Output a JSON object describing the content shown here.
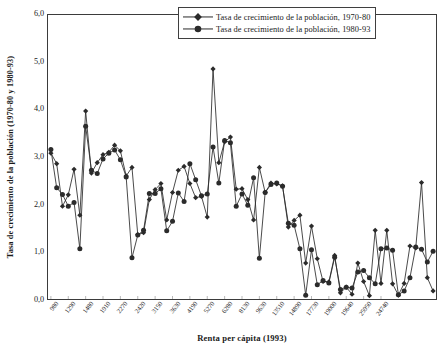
{
  "chart_data": {
    "type": "line",
    "title": "",
    "xlabel": "Renta per cápita (1993)",
    "ylabel": "Tasa de crecimiento de la población (1970-80 y 1980-93)",
    "ylim": [
      0.0,
      6.0
    ],
    "yticks": [
      "6,0",
      "5,0",
      "4,0",
      "3,0",
      "2,0",
      "1,0",
      "0,0"
    ],
    "ytick_values": [
      6.0,
      5.0,
      4.0,
      3.0,
      2.0,
      1.0,
      0.0
    ],
    "grid": false,
    "legend_position": "top-right",
    "xtick_labels": [
      "980",
      "1290",
      "1480",
      "1910",
      "2270",
      "2420",
      "3150",
      "3630",
      "4190",
      "5270",
      "6280",
      "8130",
      "9630",
      "13510",
      "14890",
      "17730",
      "19000",
      "19640",
      "25950",
      "24740"
    ],
    "xtick_indices": [
      0,
      3,
      6,
      9,
      12,
      15,
      18,
      21,
      24,
      27,
      30,
      33,
      36,
      39,
      42,
      45,
      48,
      51,
      54,
      57
    ],
    "series": [
      {
        "name": "Tasa de crecimiento de la población, 1970-80",
        "marker": "diamond",
        "color": "#2b2b2b",
        "values": [
          3.08,
          2.86,
          1.96,
          2.2,
          2.74,
          1.77,
          3.97,
          2.66,
          2.88,
          3.05,
          3.1,
          3.25,
          3.13,
          2.6,
          2.78,
          1.36,
          1.4,
          2.1,
          2.31,
          2.44,
          1.67,
          2.25,
          2.72,
          2.8,
          2.44,
          2.14,
          2.17,
          1.73,
          4.86,
          2.88,
          3.32,
          3.42,
          2.32,
          2.33,
          2.1,
          1.67,
          2.78,
          2.25,
          2.45,
          2.43,
          2.39,
          1.52,
          1.66,
          1.77,
          0.76,
          1.54,
          0.85,
          0.37,
          0.36,
          0.92,
          0.13,
          0.25,
          0.1,
          0.76,
          0.37,
          0.07,
          1.45,
          0.33,
          1.45,
          0.32,
          0.08,
          0.33,
          1.12,
          1.08,
          2.46,
          0.45,
          0.17
        ]
      },
      {
        "name": "Tasa de crecimiento de la población, 1980-93",
        "marker": "circle",
        "color": "#2b2b2b",
        "values": [
          3.16,
          2.35,
          2.21,
          1.96,
          2.04,
          1.06,
          3.65,
          2.72,
          2.65,
          2.96,
          3.08,
          3.15,
          2.94,
          2.58,
          0.87,
          1.35,
          1.45,
          2.23,
          2.23,
          2.33,
          1.44,
          1.64,
          2.24,
          2.06,
          2.86,
          2.52,
          2.18,
          2.22,
          3.21,
          2.45,
          3.35,
          3.3,
          1.96,
          2.22,
          1.98,
          2.56,
          0.86,
          2.25,
          2.42,
          2.45,
          2.38,
          1.6,
          1.56,
          1.06,
          0.08,
          1.04,
          0.3,
          0.39,
          0.34,
          0.88,
          0.2,
          0.25,
          0.23,
          0.57,
          0.6,
          0.45,
          0.32,
          1.06,
          1.08,
          1.03,
          0.09,
          0.17,
          0.45,
          1.1,
          1.05,
          0.78,
          1.01
        ]
      }
    ]
  },
  "legend": {
    "items": [
      {
        "label": "Tasa de crecimiento de la población, 1970-80",
        "marker": "diamond"
      },
      {
        "label": "Tasa de crecimiento de la población, 1980-93",
        "marker": "circle"
      }
    ]
  }
}
